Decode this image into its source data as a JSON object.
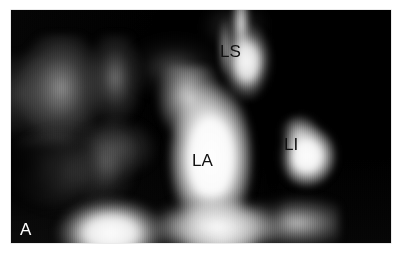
{
  "figure": {
    "panel_letter": "A",
    "modality": "grayscale-cross-sectional-scan",
    "background_color": "#ffffff",
    "image_background_color": "#050505",
    "label_color": "#111111",
    "panel_letter_color": "#ffffff"
  },
  "annotations": [
    {
      "id": "ls",
      "text": "LS",
      "meaning": "left superior pulmonary vein",
      "color": "#111111",
      "x": 209,
      "y": 33
    },
    {
      "id": "la",
      "text": "LA",
      "meaning": "left atrium",
      "color": "#111111",
      "x": 181,
      "y": 142
    },
    {
      "id": "li",
      "text": "LI",
      "meaning": "left inferior pulmonary vein",
      "color": "#111111",
      "x": 273,
      "y": 126
    }
  ],
  "structures": [
    {
      "id": "ls-structure",
      "name": "bright-tubular-structure-upper"
    },
    {
      "id": "la-structure",
      "name": "bright-central-chamber"
    },
    {
      "id": "li-structure",
      "name": "bright-round-structure-right"
    },
    {
      "id": "bottom-structure",
      "name": "bright-inferior-band"
    },
    {
      "id": "tissue-left",
      "name": "mid-gray-tissue-left"
    }
  ]
}
